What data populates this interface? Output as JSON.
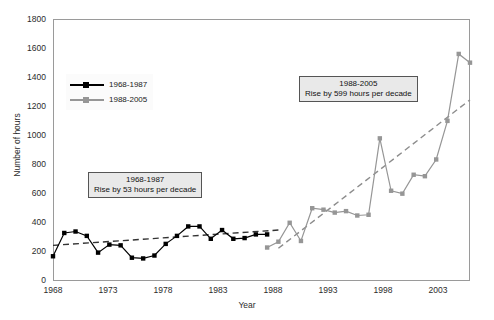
{
  "chart_data": {
    "type": "line",
    "title": "",
    "xlabel": "Year",
    "ylabel": "Number of hours",
    "xlim": [
      1968,
      2005
    ],
    "ylim": [
      0,
      1800
    ],
    "ytick_step": 200,
    "xtick_step": 5,
    "grid": false,
    "legend_position": "upper-left-inside",
    "ytick_labels": [
      "0",
      "200",
      "400",
      "600",
      "800",
      "1000",
      "1200",
      "1400",
      "1600",
      "1800"
    ],
    "xtick_labels": [
      "1968",
      "1973",
      "1978",
      "1983",
      "1988",
      "1993",
      "1998",
      "2003"
    ],
    "series": [
      {
        "name": "1968-1987",
        "color": "#000000",
        "marker": "square",
        "x": [
          1968,
          1969,
          1970,
          1971,
          1972,
          1973,
          1974,
          1975,
          1976,
          1977,
          1978,
          1979,
          1980,
          1981,
          1982,
          1983,
          1984,
          1985,
          1986,
          1987
        ],
        "values": [
          170,
          330,
          340,
          310,
          195,
          250,
          245,
          160,
          155,
          175,
          255,
          310,
          375,
          375,
          290,
          350,
          290,
          295,
          320,
          320
        ]
      },
      {
        "name": "1988-2005",
        "color": "#969696",
        "marker": "square",
        "x": [
          1987,
          1988,
          1989,
          1990,
          1991,
          1992,
          1993,
          1994,
          1995,
          1996,
          1997,
          1998,
          1999,
          2000,
          2001,
          2002,
          2003,
          2004,
          2005
        ],
        "values": [
          230,
          270,
          400,
          275,
          500,
          490,
          470,
          480,
          450,
          455,
          980,
          620,
          600,
          730,
          720,
          835,
          1100,
          1560,
          1500
        ]
      }
    ],
    "trendlines": [
      {
        "name": "1968-1987-trend",
        "color": "#333333",
        "style": "dashed",
        "x": [
          1968,
          1988
        ],
        "values": [
          245,
          350
        ]
      },
      {
        "name": "1988-2005-trend",
        "color": "#8c8c8c",
        "style": "dashed",
        "x": [
          1988,
          2005
        ],
        "values": [
          225,
          1245
        ]
      }
    ],
    "annotations": [
      {
        "name": "annotation-1968-1987",
        "line1": "1968-1987",
        "line2": "Rise by 53 hours per decade"
      },
      {
        "name": "annotation-1988-2005",
        "line1": "1988-2005",
        "line2": "Rise by 599 hours per decade"
      }
    ]
  },
  "legend": {
    "items": [
      {
        "label": "1968-1987",
        "color": "#000000"
      },
      {
        "label": "1988-2005",
        "color": "#969696"
      }
    ]
  }
}
